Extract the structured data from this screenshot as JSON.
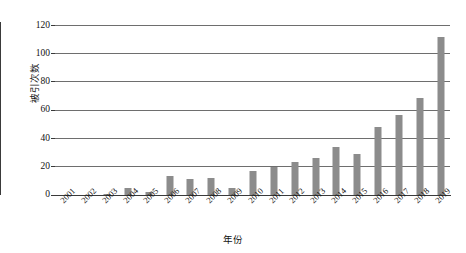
{
  "chart_data": {
    "type": "bar",
    "title": "",
    "xlabel": "年份",
    "ylabel": "被引次数",
    "categories": [
      "2001",
      "2002",
      "2003",
      "2004",
      "2005",
      "2006",
      "2007",
      "2008",
      "2009",
      "2010",
      "2011",
      "2012",
      "2013",
      "2014",
      "2015",
      "2016",
      "2017",
      "2018",
      "2019"
    ],
    "values": [
      0,
      0,
      1,
      5,
      2,
      13,
      11,
      12,
      5,
      17,
      20,
      23,
      26,
      34,
      29,
      48,
      56,
      68,
      111
    ],
    "ylim": [
      0,
      120
    ],
    "yticks": [
      0,
      20,
      40,
      60,
      80,
      100,
      120
    ],
    "ytick_labels": [
      "0",
      "20",
      "40",
      "60",
      "80",
      "100",
      "120"
    ],
    "grid": true,
    "legend": false,
    "bar_color": "#8c8c8c",
    "axis_color": "#3a3a3a",
    "grid_color": "#6e6e6e"
  }
}
